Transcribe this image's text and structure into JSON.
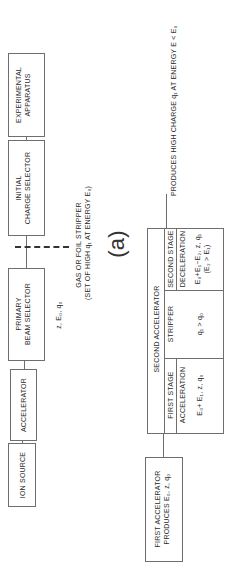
{
  "figure_label": "(a)",
  "upper_chain": {
    "boxes": [
      {
        "id": "ion-source",
        "lines": [
          "ION SOURCE"
        ]
      },
      {
        "id": "accelerator",
        "lines": [
          "ACCELERATOR"
        ]
      },
      {
        "id": "primary-beam-selector",
        "lines": [
          "PRIMARY",
          "BEAM SELECTOR"
        ]
      },
      {
        "id": "initial-charge-selector",
        "lines": [
          "INITIAL",
          "CHARGE SELECTOR"
        ]
      },
      {
        "id": "experimental-apparatus",
        "lines": [
          "EXPERIMENTAL",
          "APPARATUS"
        ]
      }
    ],
    "beam_params_label": "z, E₀, q₀",
    "stripper_label_1": "GAS OR FOIL STRIPPER",
    "stripper_label_2": "(SET OF HIGH q₁ AT ENERGY E₀)"
  },
  "lower_chain": {
    "first_accelerator": {
      "lines": [
        "FIRST ACCELERATOR",
        "PRODUCES E₀, z, q₀"
      ]
    },
    "output_label": "PRODUCES HIGH CHARGE  q₁  AT  ENERGY  E < E₀",
    "table": {
      "header": "SECOND  ACCELERATOR",
      "first_stage": {
        "title": "FIRST STAGE",
        "process": "ACCELERATION",
        "value": "E₀+ E₁, z, q₀"
      },
      "stripper": {
        "title": "STRIPPER",
        "value": "q₁ > q₀"
      },
      "second_stage": {
        "title": "SECOND  STAGE",
        "process": "DECELERATION",
        "value_1": "E₀+E₁−E₂, z, q₁",
        "value_2": "(E₂ > E₁)"
      }
    }
  },
  "colors": {
    "line": "#6e6e6e",
    "text": "#2a2a2a",
    "background": "#ffffff"
  }
}
